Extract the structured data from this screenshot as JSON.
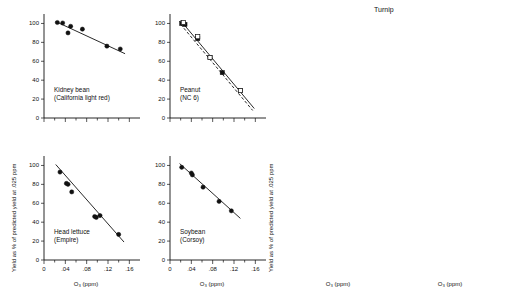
{
  "figure": {
    "ylabel": "Yield as % of predicted yield at .025 ppm",
    "xlabel": "O₃ (ppm)",
    "group_right_title": "Turnip",
    "y_ticks": [
      "0",
      "20",
      "40",
      "60",
      "80",
      "100"
    ],
    "x_ticks": [
      "0",
      ".04",
      ".08",
      ".12",
      ".16"
    ]
  },
  "chart_data": [
    {
      "type": "scatter",
      "panel_id": "kidney-bean",
      "title": "Kidney bean",
      "subtitle": "(California light red)",
      "xlabel": "O₃ (ppm)",
      "ylabel": "Yield as % of predicted yield at .025 ppm",
      "xlim": [
        0,
        0.18
      ],
      "ylim": [
        0,
        110
      ],
      "x_ticks": [
        0,
        0.04,
        0.08,
        0.12,
        0.16
      ],
      "y_ticks": [
        0,
        20,
        40,
        60,
        80,
        100
      ],
      "x_tick_labels_visible": false,
      "grid": false,
      "legend": "none",
      "series": [
        {
          "name": "observed",
          "marker": "filled-circle",
          "x": [
            0.025,
            0.035,
            0.045,
            0.05,
            0.072,
            0.118,
            0.143
          ],
          "y": [
            101,
            100.5,
            90,
            97,
            94,
            76,
            73
          ]
        }
      ],
      "fits": [
        {
          "name": "regression",
          "style": "solid",
          "x": [
            0.022,
            0.152
          ],
          "y": [
            102,
            68
          ]
        }
      ]
    },
    {
      "type": "scatter",
      "panel_id": "peanut",
      "title": "Peanut",
      "subtitle": "(NC 6)",
      "xlabel": "O₃ (ppm)",
      "ylabel": "Yield as % of predicted yield at .025 ppm",
      "xlim": [
        0,
        0.18
      ],
      "ylim": [
        0,
        110
      ],
      "x_ticks": [
        0,
        0.04,
        0.08,
        0.12,
        0.16
      ],
      "y_ticks": [
        0,
        20,
        40,
        60,
        80,
        100
      ],
      "x_tick_labels_visible": false,
      "grid": false,
      "legend": "none",
      "series": [
        {
          "name": "observed-filled",
          "marker": "filled-square",
          "x": [
            0.022,
            0.028,
            0.052,
            0.075,
            0.098,
            0.132
          ],
          "y": [
            100,
            99,
            84,
            64,
            48,
            29
          ]
        },
        {
          "name": "observed-open",
          "marker": "open-square",
          "x": [
            0.025,
            0.052,
            0.075,
            0.132
          ],
          "y": [
            101,
            86,
            64,
            29
          ]
        }
      ],
      "fits": [
        {
          "name": "regression",
          "style": "solid",
          "x": [
            0.02,
            0.158
          ],
          "y": [
            103,
            10
          ]
        },
        {
          "name": "alternate",
          "style": "dashed",
          "x": [
            0.02,
            0.155
          ],
          "y": [
            99,
            8
          ]
        }
      ]
    },
    {
      "type": "scatter",
      "panel_id": "head-lettuce",
      "title": "Head lettuce",
      "subtitle": "(Empire)",
      "xlabel": "O₃ (ppm)",
      "ylabel": "Yield as % of predicted yield at .025 ppm",
      "xlim": [
        0,
        0.18
      ],
      "ylim": [
        0,
        110
      ],
      "x_ticks": [
        0,
        0.04,
        0.08,
        0.12,
        0.16
      ],
      "y_ticks": [
        0,
        20,
        40,
        60,
        80,
        100
      ],
      "x_tick_labels_visible": true,
      "grid": false,
      "legend": "none",
      "series": [
        {
          "name": "observed",
          "marker": "filled-circle",
          "x": [
            0.03,
            0.042,
            0.045,
            0.052,
            0.095,
            0.098,
            0.105,
            0.14
          ],
          "y": [
            93,
            81,
            80,
            72,
            46,
            45,
            47,
            27
          ]
        }
      ],
      "fits": [
        {
          "name": "regression",
          "style": "solid",
          "x": [
            0.022,
            0.15
          ],
          "y": [
            101,
            19
          ]
        }
      ]
    },
    {
      "type": "scatter",
      "panel_id": "soybean",
      "title": "Soybean",
      "subtitle": "(Corsoy)",
      "xlabel": "O₃ (ppm)",
      "ylabel": "Yield as % of predicted yield at .025 ppm",
      "xlim": [
        0,
        0.18
      ],
      "ylim": [
        0,
        110
      ],
      "x_ticks": [
        0,
        0.04,
        0.08,
        0.12,
        0.16
      ],
      "y_ticks": [
        0,
        20,
        40,
        60,
        80,
        100
      ],
      "x_tick_labels_visible": true,
      "grid": false,
      "legend": "none",
      "series": [
        {
          "name": "observed",
          "marker": "filled-circle",
          "x": [
            0.022,
            0.04,
            0.042,
            0.062,
            0.092,
            0.115
          ],
          "y": [
            98,
            92,
            90,
            77,
            62,
            52
          ]
        }
      ],
      "fits": [
        {
          "name": "regression",
          "style": "solid",
          "x": [
            0.018,
            0.132
          ],
          "y": [
            102,
            44
          ]
        }
      ]
    },
    {
      "type": "scatter",
      "panel_id": "turnip-pur-top-white-gl",
      "title": "Pur. top",
      "subtitle": "white gl.",
      "group": "Turnip",
      "xlabel": "O₃ (ppm)",
      "ylabel": "Yield as % of predicted yield at .025 ppm",
      "xlim": [
        0,
        0.18
      ],
      "ylim": [
        0,
        110
      ],
      "x_ticks": [
        0,
        0.04,
        0.08,
        0.12,
        0.16
      ],
      "y_ticks": [
        0,
        20,
        40,
        60,
        80,
        100
      ],
      "x_tick_labels_visible": false,
      "grid": false,
      "legend": "none",
      "series": [
        {
          "name": "observed-open",
          "marker": "open-circle",
          "x": [
            0.018,
            0.034,
            0.062,
            0.092
          ],
          "y": [
            100,
            100,
            58,
            38
          ]
        },
        {
          "name": "observed-filled",
          "marker": "filled-circle",
          "x": [
            0.026,
            0.062,
            0.092,
            0.095
          ],
          "y": [
            99,
            57,
            38,
            36
          ]
        }
      ],
      "fits": [
        {
          "name": "regression",
          "style": "solid",
          "x": [
            0.015,
            0.115
          ],
          "y": [
            106,
            12
          ]
        },
        {
          "name": "alternate",
          "style": "dashed",
          "x": [
            0.032,
            0.112
          ],
          "y": [
            103,
            7
          ]
        }
      ]
    },
    {
      "type": "scatter",
      "panel_id": "turnip-tokyo-cross",
      "title": "Tokyo cross",
      "subtitle": "",
      "group": "Turnip",
      "xlabel": "O₃ (ppm)",
      "ylabel": "Yield as % of predicted yield at .025 ppm",
      "xlim": [
        0,
        0.18
      ],
      "ylim": [
        0,
        110
      ],
      "x_ticks": [
        0,
        0.04,
        0.08,
        0.12,
        0.16
      ],
      "y_ticks": [
        0,
        20,
        40,
        60,
        80,
        100
      ],
      "x_tick_labels_visible": false,
      "grid": false,
      "legend": "none",
      "series": [
        {
          "name": "observed-filled",
          "marker": "filled-square",
          "x": [
            0.014,
            0.03,
            0.042,
            0.078,
            0.095
          ],
          "y": [
            96,
            102,
            100,
            43,
            40
          ]
        },
        {
          "name": "observed-open",
          "marker": "open-circle",
          "x": [
            0.014,
            0.03,
            0.042,
            0.078,
            0.095
          ],
          "y": [
            99,
            101,
            100,
            42,
            38
          ]
        }
      ],
      "fits": [
        {
          "name": "regression",
          "style": "solid",
          "x": [
            0.022,
            0.125
          ],
          "y": [
            104,
            10
          ]
        },
        {
          "name": "alternate",
          "style": "dashed",
          "x": [
            0.015,
            0.108
          ],
          "y": [
            99,
            2
          ]
        }
      ]
    },
    {
      "type": "scatter",
      "panel_id": "turnip-shogoin",
      "title": "Shogoin",
      "subtitle": "",
      "group": "Turnip",
      "xlabel": "O₃ (ppm)",
      "ylabel": "Yield as % of predicted yield at .025 ppm",
      "xlim": [
        0,
        0.18
      ],
      "ylim": [
        0,
        110
      ],
      "x_ticks": [
        0,
        0.04,
        0.08,
        0.12,
        0.16
      ],
      "y_ticks": [
        0,
        20,
        40,
        60,
        80,
        100
      ],
      "x_tick_labels_visible": true,
      "grid": false,
      "legend": "none",
      "series": [
        {
          "name": "observed",
          "marker": "filled-circle",
          "x": [
            0.015,
            0.033,
            0.052,
            0.079,
            0.092
          ],
          "y": [
            103,
            92,
            87,
            40,
            46
          ]
        }
      ],
      "fits": [
        {
          "name": "regression",
          "style": "solid",
          "x": [
            0.012,
            0.118
          ],
          "y": [
            104,
            22
          ]
        }
      ]
    },
    {
      "type": "scatter",
      "panel_id": "turnip-just-right",
      "title": "Just right",
      "subtitle": "",
      "group": "Turnip",
      "xlabel": "O₃ (ppm)",
      "ylabel": "Yield as % of predicted yield at .025 ppm",
      "xlim": [
        0,
        0.18
      ],
      "ylim": [
        0,
        110
      ],
      "x_ticks": [
        0,
        0.04,
        0.08,
        0.12,
        0.16
      ],
      "y_ticks": [
        0,
        20,
        40,
        60,
        80,
        100
      ],
      "x_tick_labels_visible": true,
      "grid": false,
      "legend": "none",
      "series": [
        {
          "name": "observed-filled",
          "marker": "filled-square",
          "x": [
            0.016,
            0.034,
            0.05,
            0.056,
            0.062,
            0.092
          ],
          "y": [
            91,
            103,
            80,
            77,
            72,
            43
          ]
        },
        {
          "name": "observed-open",
          "marker": "open-circle",
          "x": [
            0.016,
            0.05,
            0.062,
            0.092,
            0.098
          ],
          "y": [
            89,
            79,
            71,
            42,
            38
          ]
        }
      ],
      "fits": [
        {
          "name": "regression",
          "style": "solid",
          "x": [
            0.014,
            0.122
          ],
          "y": [
            104,
            12
          ]
        },
        {
          "name": "alternate",
          "style": "dashed",
          "x": [
            0.03,
            0.115
          ],
          "y": [
            100,
            2
          ]
        }
      ]
    }
  ]
}
